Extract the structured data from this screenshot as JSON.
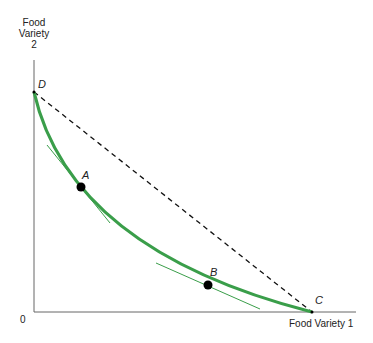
{
  "diagram": {
    "y_axis_label": [
      "Food",
      "Variety",
      "2"
    ],
    "x_axis_label": "Food Variety 1",
    "origin_label": "0",
    "points": {
      "D": "D",
      "A": "A",
      "B": "B",
      "C": "C"
    },
    "colors": {
      "curve": "#3a9e4a",
      "tangent": "#3a9e4a",
      "budget_line": "#111111",
      "axes": "#555555",
      "point": "#000000"
    }
  }
}
